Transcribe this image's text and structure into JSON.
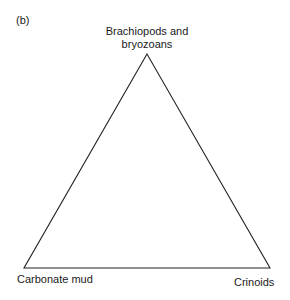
{
  "figure": {
    "panel_label": "(b)",
    "type": "ternary-triangle",
    "vertices": {
      "top": {
        "label_line1": "Brachiopods and",
        "label_line2": "bryozoans"
      },
      "bottom_left": {
        "label": "Carbonate mud"
      },
      "bottom_right": {
        "label": "Crinoids"
      }
    },
    "colors": {
      "line": "#222222",
      "text": "#1a1a1a",
      "background": "#ffffff"
    }
  }
}
